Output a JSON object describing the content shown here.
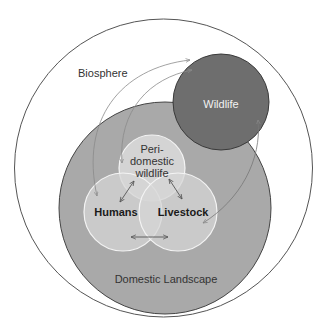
{
  "diagram": {
    "type": "nested-venn",
    "colors": {
      "background": "#ffffff",
      "biosphere_stroke": "#555555",
      "domestic_fill": "#a9a9a9",
      "domestic_stroke": "#444444",
      "wildlife_fill": "#6e6e6e",
      "wildlife_stroke": "#3a3a3a",
      "inner_fill": "#dcdcdc",
      "inner_stroke": "#f4f4f4",
      "arrow": "#555555",
      "arrow_light": "#8a8a8a"
    },
    "regions": {
      "biosphere": {
        "label": "Biosphere"
      },
      "domestic_landscape": {
        "label": "Domestic Landscape"
      },
      "wildlife": {
        "label": "Wildlife"
      },
      "peri_domestic_wildlife": {
        "label_line1": "Peri-",
        "label_line2": "domestic",
        "label_line3": "wildlife"
      },
      "humans": {
        "label": "Humans"
      },
      "livestock": {
        "label": "Livestock"
      }
    },
    "arrows": [
      {
        "from": "wildlife",
        "to": "humans",
        "bidirectional": true
      },
      {
        "from": "wildlife",
        "to": "peri_domestic_wildlife",
        "bidirectional": true
      },
      {
        "from": "wildlife",
        "to": "livestock",
        "bidirectional": true
      },
      {
        "from": "peri_domestic_wildlife",
        "to": "humans",
        "bidirectional": true
      },
      {
        "from": "peri_domestic_wildlife",
        "to": "livestock",
        "bidirectional": true
      },
      {
        "from": "humans",
        "to": "livestock",
        "bidirectional": true
      }
    ]
  }
}
